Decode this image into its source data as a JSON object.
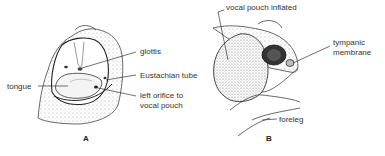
{
  "figure": {
    "panel_a": {
      "letter": "A",
      "labels": {
        "glottis": "glottis",
        "eustachian": "Eustachian tube",
        "tongue": "tongue",
        "orifice_line1": "left orifice to",
        "orifice_line2": "vocal pouch"
      }
    },
    "panel_b": {
      "letter": "B",
      "labels": {
        "pouch": "vocal pouch inflated",
        "tympanic_line1": "tympanic",
        "tympanic_line2": "membrane",
        "foreleg": "foreleg"
      }
    }
  }
}
